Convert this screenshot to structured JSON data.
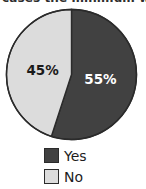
{
  "title": {
    "text_clipped": "cases the minimum wage",
    "visible": "partially clipped at top edge"
  },
  "chart_data": {
    "type": "pie",
    "title": "",
    "categories": [
      "Yes",
      "No"
    ],
    "values": [
      55,
      45
    ],
    "value_labels": [
      "55%",
      "45%"
    ],
    "colors": [
      "#414141",
      "#dcdcdc"
    ],
    "label_colors": [
      "#ffffff",
      "#1a1a1a"
    ],
    "stroke": "#2b2b2b",
    "start_angle_deg": 0,
    "direction": "clockwise",
    "legend": {
      "position": "bottom",
      "entries": [
        {
          "label": "Yes",
          "color": "#414141"
        },
        {
          "label": "No",
          "color": "#dcdcdc"
        }
      ]
    },
    "xlabel": "",
    "ylabel": "",
    "grid": false
  },
  "slices": [
    {
      "label": "Yes",
      "percent_text": "55%",
      "side": "right"
    },
    {
      "label": "No",
      "percent_text": "45%",
      "side": "left"
    }
  ]
}
